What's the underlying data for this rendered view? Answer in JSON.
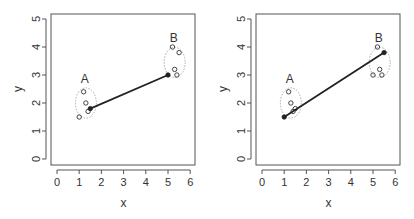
{
  "chart_data": [
    {
      "type": "scatter",
      "title": "",
      "xlabel": "x",
      "ylabel": "y",
      "xlim": [
        0,
        6
      ],
      "ylim": [
        0,
        5
      ],
      "xticks": [
        "0",
        "1",
        "2",
        "3",
        "4",
        "5",
        "6"
      ],
      "yticks": [
        "0",
        "1",
        "2",
        "3",
        "4",
        "5"
      ],
      "grid": false,
      "clusters": [
        {
          "label": "A",
          "points": [
            [
              1.2,
              2.4
            ],
            [
              1.3,
              2.0
            ],
            [
              1.0,
              1.5
            ],
            [
              1.4,
              1.7
            ],
            [
              1.5,
              1.8
            ]
          ],
          "ellipse": {
            "cx": 1.3,
            "cy": 2.0,
            "rx": 0.45,
            "ry": 0.75
          }
        },
        {
          "label": "B",
          "points": [
            [
              5.2,
              4.0
            ],
            [
              5.5,
              3.8
            ],
            [
              5.3,
              3.2
            ],
            [
              5.4,
              3.0
            ],
            [
              5.0,
              3.0
            ]
          ],
          "ellipse": {
            "cx": 5.3,
            "cy": 3.45,
            "rx": 0.45,
            "ry": 0.75
          }
        }
      ],
      "link": {
        "from": [
          1.5,
          1.8
        ],
        "to": [
          5.0,
          3.0
        ]
      }
    },
    {
      "type": "scatter",
      "title": "",
      "xlabel": "x",
      "ylabel": "y",
      "xlim": [
        0,
        6
      ],
      "ylim": [
        0,
        5
      ],
      "xticks": [
        "0",
        "1",
        "2",
        "3",
        "4",
        "5",
        "6"
      ],
      "yticks": [
        "0",
        "1",
        "2",
        "3",
        "4",
        "5"
      ],
      "grid": false,
      "clusters": [
        {
          "label": "A",
          "points": [
            [
              1.2,
              2.4
            ],
            [
              1.3,
              2.0
            ],
            [
              1.0,
              1.5
            ],
            [
              1.4,
              1.7
            ],
            [
              1.5,
              1.8
            ]
          ],
          "ellipse": {
            "cx": 1.3,
            "cy": 2.0,
            "rx": 0.45,
            "ry": 0.75
          }
        },
        {
          "label": "B",
          "points": [
            [
              5.2,
              4.0
            ],
            [
              5.5,
              3.8
            ],
            [
              5.3,
              3.2
            ],
            [
              5.4,
              3.0
            ],
            [
              5.0,
              3.0
            ]
          ],
          "ellipse": {
            "cx": 5.3,
            "cy": 3.45,
            "rx": 0.45,
            "ry": 0.75
          }
        }
      ],
      "link": {
        "from": [
          1.0,
          1.5
        ],
        "to": [
          5.5,
          3.8
        ]
      }
    }
  ],
  "colors": {
    "axis": "#555555",
    "point": "#333333",
    "line": "#222222",
    "ellipse": "#aaaaaa"
  }
}
